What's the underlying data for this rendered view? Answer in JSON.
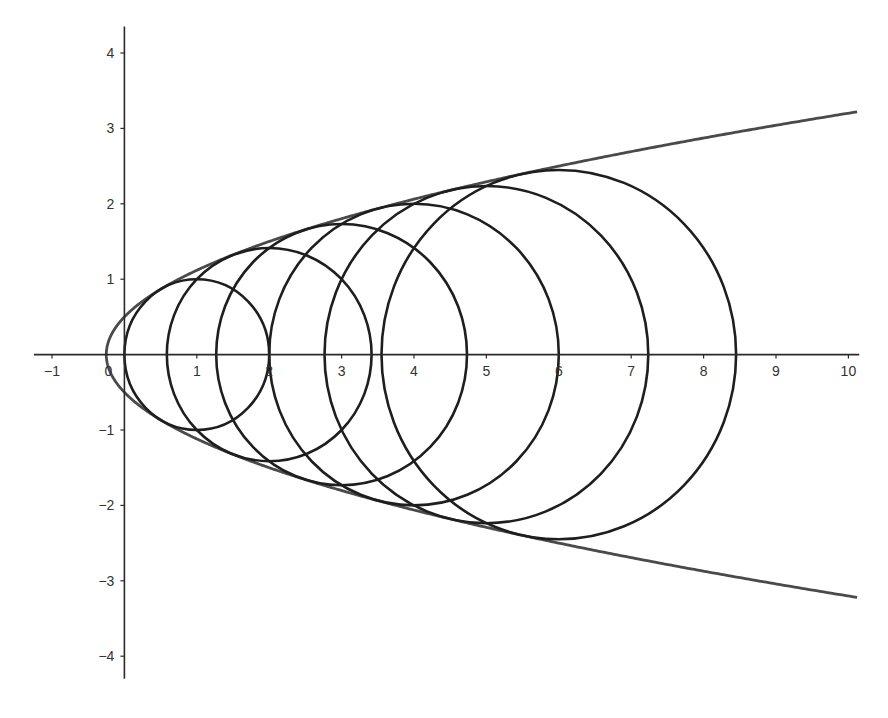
{
  "chart_data": {
    "type": "line",
    "title": "",
    "xlabel": "",
    "ylabel": "",
    "xlim": [
      -1.25,
      10.15
    ],
    "ylim": [
      -4.3,
      4.35
    ],
    "grid": false,
    "legend": null,
    "x_ticks": [
      -1,
      0,
      1,
      2,
      3,
      4,
      5,
      6,
      7,
      8,
      9,
      10
    ],
    "x_tick_labels": [
      "−1",
      "0",
      "1",
      "2",
      "3",
      "4",
      "5",
      "6",
      "7",
      "8",
      "9",
      "10"
    ],
    "y_ticks": [
      4,
      3,
      2,
      1,
      -1,
      -2,
      -3,
      -4
    ],
    "y_tick_labels": [
      "4",
      "3",
      "2",
      "1",
      "−1",
      "−2",
      "−3",
      "−4"
    ],
    "series": [
      {
        "name": "envelope parabola",
        "kind": "curve",
        "equation": "y^2 = x + 1/4",
        "x_range": [
          -0.25,
          10.12
        ],
        "color": "#4a4a4a"
      },
      {
        "name": "circles",
        "kind": "circles",
        "equation": "(x - a)^2 + y^2 = a",
        "color": "#1e1e1e",
        "circles": [
          {
            "cx": 1,
            "cy": 0,
            "r": 1.0
          },
          {
            "cx": 2,
            "cy": 0,
            "r": 1.414
          },
          {
            "cx": 3,
            "cy": 0,
            "r": 1.732
          },
          {
            "cx": 4,
            "cy": 0,
            "r": 2.0
          },
          {
            "cx": 5,
            "cy": 0,
            "r": 2.236
          },
          {
            "cx": 6,
            "cy": 0,
            "r": 2.449
          }
        ]
      }
    ]
  },
  "axes": {
    "origin_label": "0"
  }
}
